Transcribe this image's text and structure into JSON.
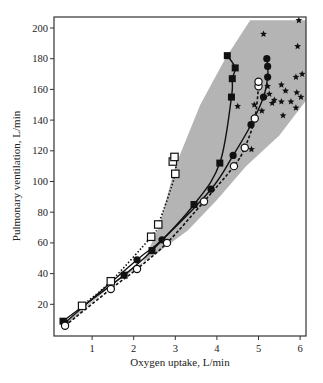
{
  "chart_data": {
    "type": "scatter",
    "title": "",
    "xlabel": "Oxygen uptake, L/min",
    "ylabel": "Pulmonary ventilation, L/min",
    "xlim": [
      0.1,
      6.15
    ],
    "ylim": [
      0,
      205
    ],
    "xticks": [
      1,
      2,
      3,
      4,
      5,
      6
    ],
    "yticks": [
      20,
      40,
      60,
      80,
      100,
      120,
      140,
      160,
      180,
      200
    ],
    "grid": false,
    "legend": null,
    "colors": {
      "band": "#b4b4b4",
      "ink": "#111111",
      "frame": "#333333"
    },
    "band": {
      "description": "shaded gray region",
      "polygon": [
        [
          0.4,
          9
        ],
        [
          1.5,
          33
        ],
        [
          2.2,
          46
        ],
        [
          2.6,
          70
        ],
        [
          3.0,
          110
        ],
        [
          3.6,
          150
        ],
        [
          4.2,
          180
        ],
        [
          4.8,
          205
        ],
        [
          6.15,
          205
        ],
        [
          6.15,
          153
        ],
        [
          5.5,
          130
        ],
        [
          4.7,
          110
        ],
        [
          4.0,
          88
        ],
        [
          3.3,
          68
        ],
        [
          2.6,
          54
        ],
        [
          1.8,
          40
        ],
        [
          0.4,
          7
        ]
      ]
    },
    "series": [
      {
        "name": "filled-squares",
        "marker": "square-filled",
        "line": "solid",
        "points": [
          [
            0.3,
            9
          ],
          [
            1.77,
            39
          ],
          [
            2.44,
            55
          ],
          [
            3.45,
            85
          ],
          [
            4.07,
            112
          ],
          [
            4.35,
            155
          ],
          [
            4.37,
            167
          ],
          [
            4.44,
            174
          ],
          [
            4.25,
            182
          ]
        ]
      },
      {
        "name": "open-squares",
        "marker": "square-open",
        "line": "dotted",
        "points": [
          [
            0.76,
            19
          ],
          [
            1.45,
            35
          ],
          [
            2.42,
            64
          ],
          [
            2.59,
            72
          ],
          [
            3.0,
            105
          ],
          [
            2.94,
            113
          ],
          [
            2.98,
            116
          ]
        ]
      },
      {
        "name": "filled-circles",
        "marker": "circle-filled",
        "line": "solid",
        "points": [
          [
            0.35,
            8
          ],
          [
            2.08,
            49
          ],
          [
            2.68,
            62
          ],
          [
            3.86,
            95
          ],
          [
            4.39,
            117
          ],
          [
            4.82,
            137
          ],
          [
            5.12,
            155
          ],
          [
            5.22,
            168
          ],
          [
            5.22,
            175
          ],
          [
            5.2,
            180
          ]
        ]
      },
      {
        "name": "open-circles",
        "marker": "circle-open",
        "line": "dashed",
        "points": [
          [
            0.35,
            6
          ],
          [
            1.45,
            30
          ],
          [
            2.08,
            43
          ],
          [
            2.8,
            60
          ],
          [
            3.69,
            87
          ],
          [
            4.41,
            110
          ],
          [
            4.67,
            122
          ],
          [
            4.91,
            141
          ],
          [
            5.0,
            162
          ],
          [
            5.0,
            165
          ]
        ]
      },
      {
        "name": "stars",
        "marker": "star",
        "line": "none",
        "points": [
          [
            5.97,
            205
          ],
          [
            5.12,
            196
          ],
          [
            5.94,
            188
          ],
          [
            6.05,
            170
          ],
          [
            5.9,
            168
          ],
          [
            5.92,
            158
          ],
          [
            6.02,
            155
          ],
          [
            5.55,
            163
          ],
          [
            5.65,
            159
          ],
          [
            5.55,
            152
          ],
          [
            5.78,
            152
          ],
          [
            5.9,
            148
          ],
          [
            5.59,
            143
          ],
          [
            4.83,
            121
          ],
          [
            4.5,
            149
          ],
          [
            5.22,
            162
          ],
          [
            5.26,
            157
          ],
          [
            5.33,
            151
          ],
          [
            5.38,
            153
          ],
          [
            4.9,
            150
          ],
          [
            5.08,
            146
          ]
        ]
      }
    ]
  }
}
